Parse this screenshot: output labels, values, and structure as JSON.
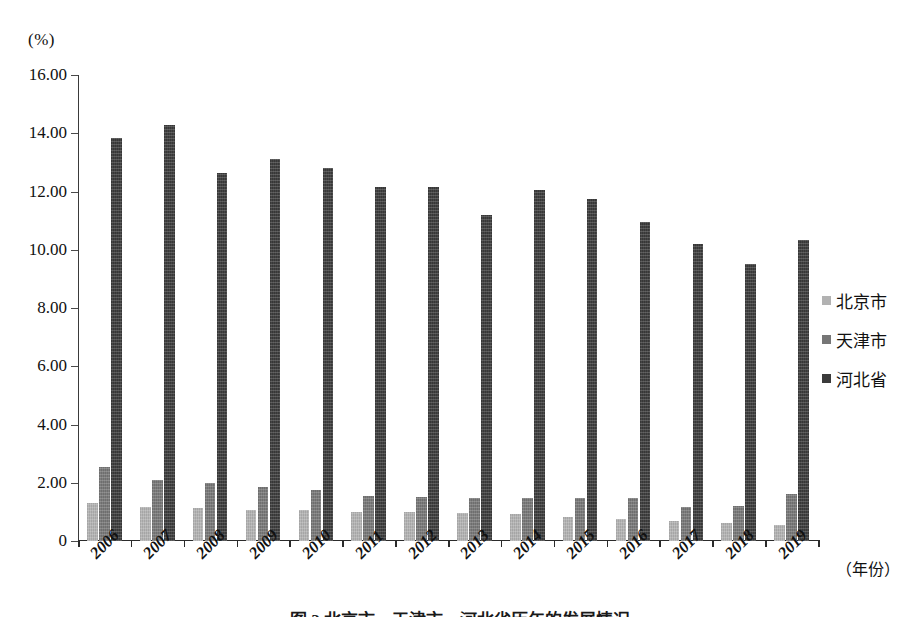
{
  "figure": {
    "unit_label": "(%)",
    "caption": "图 2 北京市、天津市、河北省历年的发展情况"
  },
  "legend": {
    "position": "right",
    "items": [
      {
        "label": "北京市",
        "color": "#b2b2b2"
      },
      {
        "label": "天津市",
        "color": "#767676"
      },
      {
        "label": "河北省",
        "color": "#3b3b3b"
      }
    ]
  },
  "axes": {
    "x_title": "（年份）",
    "y_ticks": [
      "0",
      "2.00",
      "4.00",
      "6.00",
      "8.00",
      "10.00",
      "12.00",
      "14.00",
      "16.00"
    ]
  },
  "chart_data": {
    "type": "bar",
    "title": "",
    "subtitle": "",
    "xlabel": "（年份）",
    "ylabel": "(%)",
    "ylim": [
      0,
      16
    ],
    "ytick_values": [
      0,
      2,
      4,
      6,
      8,
      10,
      12,
      14,
      16
    ],
    "grid": false,
    "legend_position": "right",
    "categories": [
      "2006",
      "2007",
      "2008",
      "2009",
      "2010",
      "2011",
      "2012",
      "2013",
      "2014",
      "2015",
      "2016",
      "2017",
      "2018",
      "2019"
    ],
    "series": [
      {
        "name": "北京市",
        "color": "#b2b2b2",
        "values": [
          1.3,
          1.18,
          1.12,
          1.08,
          1.05,
          0.98,
          0.98,
          0.95,
          0.92,
          0.84,
          0.74,
          0.7,
          0.62,
          0.55
        ]
      },
      {
        "name": "天津市",
        "color": "#767676",
        "values": [
          2.55,
          2.1,
          2.0,
          1.86,
          1.74,
          1.55,
          1.5,
          1.46,
          1.46,
          1.48,
          1.47,
          1.18,
          1.2,
          1.62
        ]
      },
      {
        "name": "河北省",
        "color": "#3b3b3b",
        "values": [
          13.85,
          14.28,
          12.64,
          13.12,
          12.8,
          12.14,
          12.14,
          11.18,
          12.06,
          11.76,
          10.96,
          10.2,
          9.52,
          10.34
        ]
      }
    ]
  }
}
